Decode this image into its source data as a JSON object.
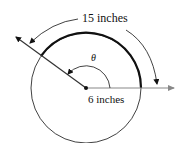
{
  "diagram": {
    "arc_length_label": "15 inches",
    "radius_label": "6 inches",
    "angle_label": "θ",
    "colors": {
      "lines": "#111111",
      "ray": "#888888",
      "background": "#ffffff"
    }
  }
}
